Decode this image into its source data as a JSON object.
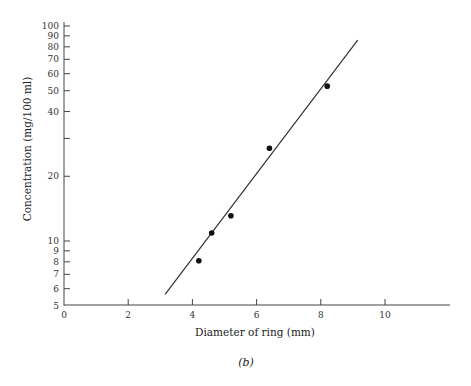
{
  "chart_data": {
    "type": "scatter",
    "title": "",
    "caption": "(b)",
    "xlabel": "Diameter of ring (mm)",
    "ylabel": "Concentration (mg/100 ml)",
    "xscale": "linear",
    "yscale": "log",
    "xlim": [
      0,
      12
    ],
    "ylim": [
      5,
      100
    ],
    "x_ticks": [
      0,
      2,
      4,
      6,
      8,
      10
    ],
    "x_tick_labels": [
      "0",
      "2",
      "4",
      "6",
      "8",
      "10"
    ],
    "y_ticks": [
      5,
      6,
      7,
      8,
      9,
      10,
      20,
      30,
      40,
      50,
      60,
      70,
      80,
      90,
      100
    ],
    "y_tick_labels": [
      "5",
      "6",
      "7",
      "8",
      "9",
      "10",
      "20",
      "",
      "40",
      "50",
      "60",
      "70",
      "80",
      "90",
      "100"
    ],
    "grid": false,
    "legend": null,
    "series": [
      {
        "name": "Measured points",
        "kind": "scatter",
        "x": [
          4.2,
          4.6,
          5.2,
          6.4,
          8.2
        ],
        "y": [
          8.1,
          10.9,
          13.1,
          27.0,
          52.5
        ]
      },
      {
        "name": "Fitted line",
        "kind": "line",
        "x": [
          3.15,
          9.15
        ],
        "y": [
          5.65,
          86.0
        ]
      }
    ]
  },
  "layout": {
    "x0_px": 64,
    "px_per_x_unit": 32.1,
    "y_decade_px": 215,
    "y10_px": 241,
    "x_axis_y_px": 305,
    "x_axis_end_px": 450,
    "y_axis_top_px": 22
  }
}
